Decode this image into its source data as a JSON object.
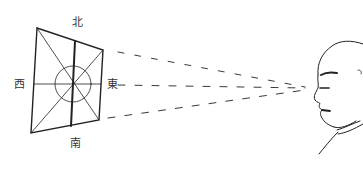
{
  "figure": {
    "type": "illustration",
    "direction_labels": {
      "north": "北",
      "south": "南",
      "east": "東",
      "west": "西"
    },
    "colors": {
      "ink": "#222222",
      "background": "#ffffff"
    }
  }
}
